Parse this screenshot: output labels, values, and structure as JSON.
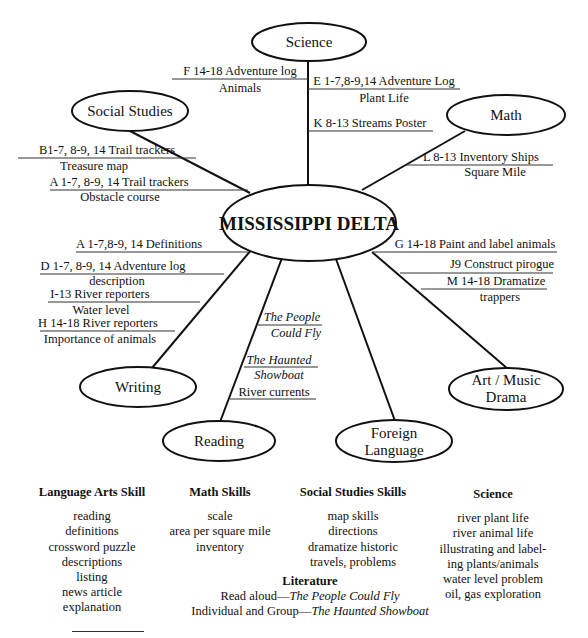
{
  "diagram": {
    "center": {
      "label": "MISSISSIPPI DELTA"
    },
    "nodes": {
      "science": {
        "label": "Science"
      },
      "social_studies": {
        "label": "Social Studies"
      },
      "math": {
        "label": "Math"
      },
      "writing": {
        "label": "Writing"
      },
      "reading": {
        "label": "Reading"
      },
      "foreign_language": {
        "line1": "Foreign",
        "line2": "Language"
      },
      "art_music": {
        "line1": "Art / Music",
        "line2": "Drama"
      }
    },
    "activities": {
      "science": [
        {
          "title": "F 14-18 Adventure log",
          "subtitle": "Animals"
        },
        {
          "title": "E 1-7,8-9,14 Adventure Log",
          "subtitle": "Plant Life"
        },
        {
          "title": "K 8-13 Streams Poster",
          "subtitle": ""
        }
      ],
      "social_studies": [
        {
          "title": "B1-7, 8-9, 14 Trail trackers",
          "subtitle": "Treasure map"
        },
        {
          "title": "A 1-7, 8-9, 14 Trail trackers",
          "subtitle": "Obstacle course"
        }
      ],
      "math": [
        {
          "title": "L 8-13 Inventory Ships",
          "subtitle": "Square Mile"
        }
      ],
      "writing": [
        {
          "title": "A 1-7,8-9, 14 Definitions",
          "subtitle": ""
        },
        {
          "title": "D 1-7, 8-9, 14 Adventure log",
          "subtitle": "description"
        },
        {
          "title": "I-13 River reporters",
          "subtitle": "Water level"
        },
        {
          "title": "H 14-18 River reporters",
          "subtitle": "Importance of animals"
        }
      ],
      "reading": [
        {
          "title": "The People",
          "subtitle": "Could Fly"
        },
        {
          "title": "The Haunted",
          "subtitle": "Showboat"
        },
        {
          "title": "River currents",
          "subtitle": ""
        }
      ],
      "art_music": [
        {
          "title": "G 14-18 Paint and label animals",
          "subtitle": ""
        },
        {
          "title": "J9 Construct pirogue",
          "subtitle": ""
        },
        {
          "title": "M 14-18 Dramatize",
          "subtitle": "trappers"
        }
      ]
    }
  },
  "skills": {
    "language_arts": {
      "heading": "Language Arts Skill",
      "items": [
        "reading",
        "definitions",
        "crossword puzzle",
        "descriptions",
        "listing",
        "news article",
        "explanation"
      ]
    },
    "math": {
      "heading": "Math Skills",
      "items": [
        "scale",
        "area per square mile",
        "inventory"
      ]
    },
    "social_studies": {
      "heading": "Social Studies Skills",
      "items": [
        "map skills",
        "directions",
        "dramatize historic",
        "travels, problems"
      ]
    },
    "science": {
      "heading": "Science",
      "items": [
        "river plant life",
        "river animal life",
        "illustrating and label-",
        "ing plants/animals",
        "water level problem",
        "oil, gas exploration"
      ]
    },
    "literature": {
      "heading": "Literature",
      "line1_prefix": "Read aloud—",
      "line1_title": "The People Could Fly",
      "line2_prefix": "Individual and Group—",
      "line2_title": "The Haunted Showboat"
    }
  }
}
